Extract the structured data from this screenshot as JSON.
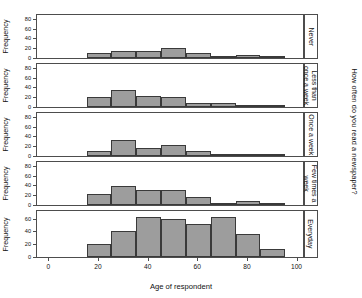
{
  "chart_data": {
    "type": "bar",
    "chart_style": "trellis-histogram",
    "title": "",
    "xlabel": "Age of respondent",
    "ylabel": "Frequency",
    "strip_title": "How often do you read a newspaper?",
    "xlim": [
      -5,
      103
    ],
    "xticks": [
      0,
      20,
      40,
      60,
      80,
      100
    ],
    "xtick_labels": [
      "0",
      "20",
      "40",
      "60",
      "80",
      "100"
    ],
    "bin_width": 10,
    "bin_starts": [
      15,
      25,
      35,
      45,
      55,
      65,
      75,
      85
    ],
    "grid": false,
    "legend": "none",
    "bar_fill": "#9d9d9d",
    "bar_stroke": "#3a3a3a",
    "panel_border": "#4d4d4d",
    "panels": [
      {
        "label": "Never",
        "label_lines": [
          "Never"
        ],
        "ylim": [
          0,
          88
        ],
        "yticks": [
          0,
          20,
          40,
          60,
          80
        ],
        "ytick_labels": [
          "0",
          "20",
          "40",
          "60",
          "80"
        ],
        "values": [
          10,
          15,
          15,
          21,
          10,
          2,
          7,
          1
        ]
      },
      {
        "label": "Less than once a week",
        "label_lines": [
          "Less than",
          "once a week"
        ],
        "ylim": [
          0,
          88
        ],
        "yticks": [
          0,
          20,
          40,
          60,
          80
        ],
        "ytick_labels": [
          "0",
          "20",
          "40",
          "60",
          "80"
        ],
        "values": [
          20,
          34,
          23,
          21,
          8,
          8,
          3,
          1
        ]
      },
      {
        "label": "Once a week",
        "label_lines": [
          "Once a week"
        ],
        "ylim": [
          0,
          88
        ],
        "yticks": [
          0,
          20,
          40,
          60,
          80
        ],
        "ytick_labels": [
          "0",
          "20",
          "40",
          "60",
          "80"
        ],
        "values": [
          10,
          33,
          17,
          22,
          11,
          2,
          5,
          1
        ]
      },
      {
        "label": "Few times a week",
        "label_lines": [
          "Few times a",
          "week"
        ],
        "ylim": [
          0,
          88
        ],
        "yticks": [
          0,
          20,
          40,
          60,
          80
        ],
        "ytick_labels": [
          "0",
          "20",
          "40",
          "60",
          "80"
        ],
        "values": [
          23,
          38,
          30,
          30,
          16,
          3,
          8,
          0
        ]
      },
      {
        "label": "Everyday",
        "label_lines": [
          "Everyday"
        ],
        "ylim": [
          0,
          72
        ],
        "yticks": [
          0,
          20,
          40,
          60
        ],
        "ytick_labels": [
          "0",
          "20",
          "40",
          "60"
        ],
        "values": [
          20,
          41,
          63,
          60,
          52,
          62,
          36,
          12
        ]
      }
    ]
  }
}
